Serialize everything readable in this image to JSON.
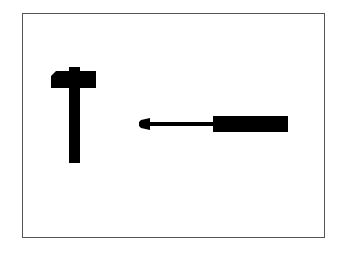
{
  "figure": {
    "frame_color": "#555555",
    "shape_color": "#000000",
    "items": [
      {
        "name": "hammer",
        "icon": "hammer-icon"
      },
      {
        "name": "screwdriver",
        "icon": "screwdriver-icon"
      }
    ]
  }
}
